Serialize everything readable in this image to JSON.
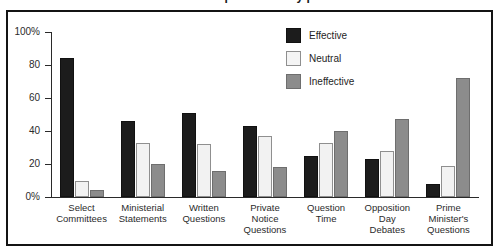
{
  "chart_data": {
    "type": "bar",
    "title": "Effectiveness of parliamentary procedures",
    "xlabel": "",
    "ylabel": "",
    "ylim": [
      0,
      100
    ],
    "ytick_labels": [
      "100%",
      "80",
      "60",
      "40",
      "20",
      "0%"
    ],
    "ytick_values": [
      100,
      80,
      60,
      40,
      20,
      0
    ],
    "grid": false,
    "legend_position": "top-right",
    "categories": [
      "Select Committees",
      "Ministerial Statements",
      "Written Questions",
      "Private Notice Questions",
      "Question Time",
      "Opposition Day Debates",
      "Prime Minister's Questions"
    ],
    "category_lines": [
      [
        "Select",
        "Committees"
      ],
      [
        "Ministerial",
        "Statements"
      ],
      [
        "Written",
        "Questions"
      ],
      [
        "Private",
        "Notice",
        "Questions"
      ],
      [
        "Question",
        "Time"
      ],
      [
        "Opposition",
        "Day",
        "Debates"
      ],
      [
        "Prime",
        "Minister's",
        "Questions"
      ]
    ],
    "series": [
      {
        "name": "Effective",
        "color": "#1c1c1c",
        "values": [
          84,
          46,
          51,
          43,
          25,
          23,
          8
        ]
      },
      {
        "name": "Neutral",
        "color": "#f2f2f2",
        "values": [
          10,
          33,
          32,
          37,
          33,
          28,
          19
        ]
      },
      {
        "name": "Ineffective",
        "color": "#8c8c8c",
        "values": [
          4,
          20,
          16,
          18,
          40,
          47,
          72
        ]
      }
    ]
  },
  "legend": {
    "items": [
      {
        "label": "Effective"
      },
      {
        "label": "Neutral"
      },
      {
        "label": "Ineffective"
      }
    ]
  }
}
